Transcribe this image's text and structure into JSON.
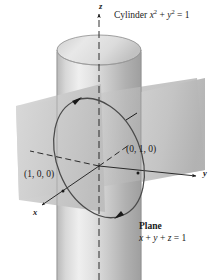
{
  "figure": {
    "kind": "3d-math-diagram",
    "background_color": "#ffffff",
    "annotations": {
      "cylinder_label": "Cylinder",
      "cylinder_eq_var1": "x",
      "cylinder_eq_exp1": "2",
      "cylinder_eq_plus": "+",
      "cylinder_eq_var2": "y",
      "cylinder_eq_exp2": "2",
      "cylinder_eq_rhs": "= 1",
      "cylinder_full": "Cylinder x2 + y2 = 1",
      "plane_label": "Plane",
      "plane_eq_x": "x",
      "plane_eq_plus1": "+",
      "plane_eq_y": "y",
      "plane_eq_plus2": "+",
      "plane_eq_z": "z",
      "plane_eq_rhs": "= 1",
      "plane_full": "Plane x + y + z = 1",
      "point_x_intercept": "(1, 0, 0)",
      "point_y_intercept": "(0, 1, 0)"
    },
    "axes": {
      "x_label": "x",
      "y_label": "y",
      "z_label": "z"
    },
    "colors": {
      "stroke": "#1a1a1a",
      "cylinder_light": "#f0f0f0",
      "cylinder_mid": "#d2d2d2",
      "cylinder_dark": "#a8a8a8",
      "plane_light": "#e2e2e2",
      "plane_dark": "#b4b4b4",
      "background": "#ffffff"
    }
  }
}
